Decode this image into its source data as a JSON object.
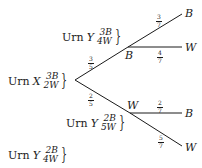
{
  "diagram": {
    "type": "probability-tree",
    "root": {
      "label": {
        "word": "Urn",
        "name": "X",
        "top": "3B",
        "bottom": "2W"
      }
    },
    "branches": [
      {
        "prob": {
          "num": "3",
          "den": "5"
        },
        "node": "B",
        "urn": {
          "word": "Urn",
          "name": "Y",
          "top": "3B",
          "bottom": "4W"
        },
        "children": [
          {
            "prob": {
              "num": "3",
              "den": "7"
            },
            "outcome": "B"
          },
          {
            "prob": {
              "num": "4",
              "den": "7"
            },
            "outcome": "W"
          }
        ]
      },
      {
        "prob": {
          "num": "2",
          "den": "5"
        },
        "node": "W",
        "urn": {
          "word": "Urn",
          "name": "Y",
          "top": "2B",
          "bottom": "5W"
        },
        "children": [
          {
            "prob": {
              "num": "2",
              "den": "7"
            },
            "outcome": "B"
          },
          {
            "prob": {
              "num": "5",
              "den": "7"
            },
            "outcome": "W"
          }
        ]
      }
    ],
    "initial_urn_y": {
      "word": "Urn",
      "name": "Y",
      "top": "2B",
      "bottom": "4W"
    }
  },
  "colors": {
    "ink": "#1a1a1a",
    "background": "#ffffff"
  }
}
